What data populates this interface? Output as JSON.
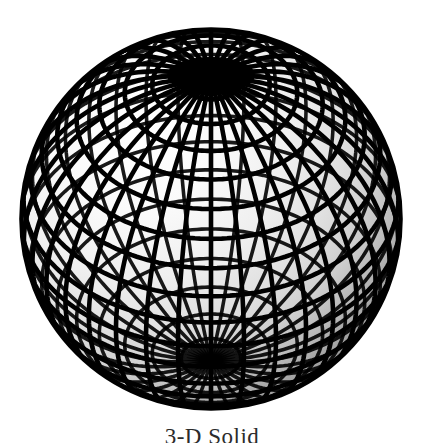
{
  "canvas": {
    "width": 424,
    "height": 443,
    "background_color": "#ffffff"
  },
  "figure": {
    "name": "wireframe-sphere",
    "kind": "3d-shaded-wireframe-globe",
    "center_x": 211,
    "center_y": 219,
    "radius": 190,
    "bounds": {
      "left": 22,
      "top": 28,
      "right": 400,
      "bottom": 410
    },
    "mesh": {
      "meridian_count": 36,
      "parallel_count": 20,
      "line_color": "#000000",
      "line_width": 4.6,
      "pole_visible": "north",
      "pole_screen_x": 211,
      "pole_screen_y": 75,
      "view_tilt_degrees": 42
    },
    "shading": {
      "model": "diffuse-lambert",
      "light_direction": "upper-left",
      "highlight_color": "#fdfdfd",
      "mid_color": "#d9d9d9",
      "shadow_color": "#7d7d7d",
      "terminator_color": "#8f8f8f"
    }
  },
  "caption": {
    "text": "3-D Solid",
    "clipped": true
  }
}
